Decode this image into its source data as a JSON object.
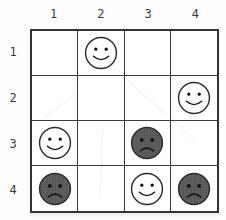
{
  "board": {
    "grid_size": 4,
    "column_labels": [
      "1",
      "2",
      "3",
      "4"
    ],
    "row_labels": [
      "1",
      "2",
      "3",
      "4"
    ],
    "pieces": [
      {
        "row": 1,
        "col": 2,
        "face": "happy",
        "shade": "light"
      },
      {
        "row": 2,
        "col": 4,
        "face": "happy",
        "shade": "light"
      },
      {
        "row": 3,
        "col": 1,
        "face": "happy",
        "shade": "light"
      },
      {
        "row": 3,
        "col": 3,
        "face": "sad",
        "shade": "dark"
      },
      {
        "row": 4,
        "col": 1,
        "face": "sad",
        "shade": "dark"
      },
      {
        "row": 4,
        "col": 3,
        "face": "happy",
        "shade": "light"
      },
      {
        "row": 4,
        "col": 4,
        "face": "sad",
        "shade": "dark"
      }
    ],
    "colors": {
      "background": "#fefefe",
      "grid_line": "#3c3c3c",
      "outer_border": "#333333",
      "light_face_fill": "#ffffff",
      "dark_face_fill": "#5c5c5c",
      "face_stroke": "#2b2b2b",
      "feature_color": "#111111",
      "label_color": "#3a3a3a"
    }
  }
}
